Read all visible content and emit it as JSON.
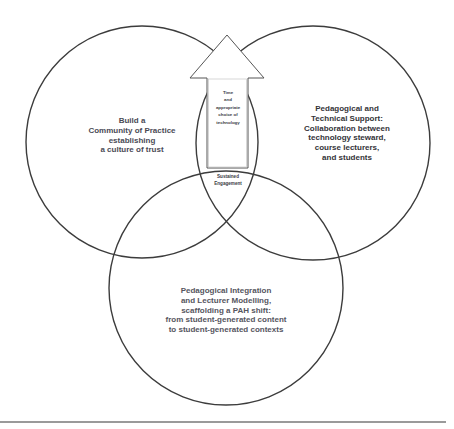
{
  "diagram": {
    "type": "venn",
    "circles": [
      {
        "id": "left",
        "label": "Build a\nCommunity of Practice\nestablishing\na culture of trust"
      },
      {
        "id": "right",
        "label": "Pedagogical and\nTechnical Support:\nCollaboration between\ntechnology steward,\ncourse lecturers,\nand students"
      },
      {
        "id": "bottom",
        "label": "Pedagogical Integration\nand Lecturer Modelling,\nscaffolding a PAH shift:\nfrom student-generated content\nto student-generated contexts"
      }
    ],
    "arrow": {
      "direction": "up",
      "label": "Time\nand\nappropriate\nchoice of\ntechnology"
    },
    "center": {
      "label": "Sustained\nEngagement"
    }
  },
  "colors": {
    "stroke": "#3c3c3c",
    "arrow_fill": "#ffffff",
    "text": "#4a4a55",
    "rule": "#9a9a9a"
  }
}
